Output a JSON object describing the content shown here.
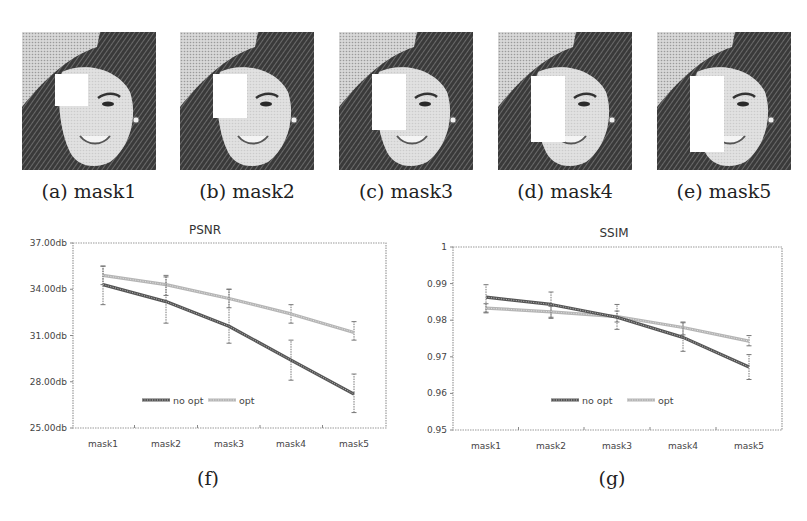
{
  "figure": {
    "panels": [
      {
        "id": "a",
        "caption": "(a) mask1",
        "mask": {
          "x": 33,
          "y": 42,
          "w": 33,
          "h": 32
        }
      },
      {
        "id": "b",
        "caption": "(b) mask2",
        "mask": {
          "x": 33,
          "y": 42,
          "w": 34,
          "h": 44
        }
      },
      {
        "id": "c",
        "caption": "(c) mask3",
        "mask": {
          "x": 33,
          "y": 42,
          "w": 34,
          "h": 56
        }
      },
      {
        "id": "d",
        "caption": "(d) mask4",
        "mask": {
          "x": 33,
          "y": 44,
          "w": 34,
          "h": 66
        }
      },
      {
        "id": "e",
        "caption": "(e) mask5",
        "mask": {
          "x": 33,
          "y": 44,
          "w": 34,
          "h": 76
        }
      }
    ],
    "chart_captions": {
      "f": "(f)",
      "g": "(g)"
    }
  },
  "chart_data": [
    {
      "type": "line",
      "title": "PSNR",
      "xlabel": "",
      "ylabel": "",
      "categories": [
        "mask1",
        "mask2",
        "mask3",
        "mask4",
        "mask5"
      ],
      "yticks": [
        "37.00db",
        "34.00db",
        "31.00db",
        "28.00db",
        "25.00db"
      ],
      "ylim": [
        25,
        37
      ],
      "grid": false,
      "legend_position": "bottom-center (inside plot)",
      "series": [
        {
          "name": "no opt",
          "color": "#555555",
          "values": [
            34.3,
            33.2,
            31.6,
            29.4,
            27.2
          ],
          "error_low": [
            33.0,
            31.8,
            30.5,
            28.1,
            26.0
          ],
          "error_high": [
            35.5,
            34.8,
            34.0,
            30.7,
            28.5
          ]
        },
        {
          "name": "opt",
          "color": "#b5b5b5",
          "values": [
            34.9,
            34.3,
            33.4,
            32.4,
            31.2
          ],
          "error_low": [
            34.3,
            33.6,
            32.8,
            31.8,
            30.7
          ],
          "error_high": [
            35.5,
            34.9,
            34.0,
            33.0,
            31.9
          ]
        }
      ]
    },
    {
      "type": "line",
      "title": "SSIM",
      "xlabel": "",
      "ylabel": "",
      "categories": [
        "mask1",
        "mask2",
        "mask3",
        "mask4",
        "mask5"
      ],
      "yticks": [
        "1",
        "0.99",
        "0.98",
        "0.97",
        "0.96",
        "0.95"
      ],
      "ylim": [
        0.95,
        1.0
      ],
      "grid": false,
      "legend_position": "bottom-center (inside plot)",
      "series": [
        {
          "name": "no opt",
          "color": "#555555",
          "values": [
            0.9863,
            0.9843,
            0.9808,
            0.9753,
            0.9672
          ],
          "error_low": [
            0.982,
            0.9805,
            0.9775,
            0.9715,
            0.9638
          ],
          "error_high": [
            0.9897,
            0.9877,
            0.9843,
            0.9793,
            0.9706
          ]
        },
        {
          "name": "opt",
          "color": "#b5b5b5",
          "values": [
            0.9833,
            0.9823,
            0.981,
            0.978,
            0.9743
          ],
          "error_low": [
            0.9822,
            0.9808,
            0.9795,
            0.976,
            0.973
          ],
          "error_high": [
            0.9845,
            0.9838,
            0.9825,
            0.9795,
            0.9758
          ]
        }
      ]
    }
  ]
}
